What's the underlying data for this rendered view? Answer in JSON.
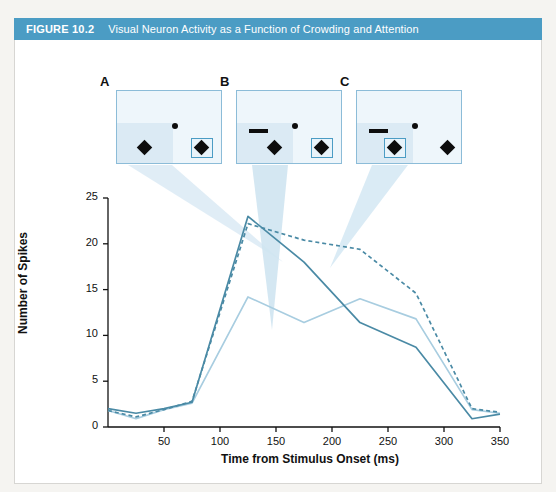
{
  "figure": {
    "number_label": "FIGURE 10.2",
    "title": "Visual Neuron Activity as a Function of Crowding and Attention",
    "header_color": "#4b9cc4",
    "border_color": "#d7d6d3",
    "background_color": "#ffffff"
  },
  "panels": [
    {
      "letter": "A",
      "description": "Isolated target in receptive field, attention directed to right diamond",
      "has_flanker_bar": false,
      "attention_box_on": "right-diamond",
      "items": [
        "fixation-dot",
        "rf-diamond",
        "right-diamond"
      ]
    },
    {
      "letter": "B",
      "description": "Flanker bar added near receptive field, attention directed to right diamond",
      "has_flanker_bar": true,
      "attention_box_on": "right-diamond",
      "items": [
        "flanker-bar",
        "fixation-dot",
        "rf-diamond",
        "right-diamond"
      ]
    },
    {
      "letter": "C",
      "description": "Flanker bar present, attention directed to diamond inside receptive field",
      "has_flanker_bar": true,
      "attention_box_on": "rf-diamond",
      "items": [
        "flanker-bar",
        "fixation-dot",
        "rf-diamond",
        "right-diamond"
      ]
    }
  ],
  "chart_data": {
    "type": "line",
    "title": "",
    "xlabel": "Time from Stimulus Onset (ms)",
    "ylabel": "Number of Spikes",
    "xlim": [
      0,
      350
    ],
    "ylim": [
      0,
      25
    ],
    "xticks": [
      50,
      100,
      150,
      200,
      250,
      300,
      350
    ],
    "yticks": [
      0,
      5,
      10,
      15,
      20,
      25
    ],
    "grid": false,
    "legend_position": "none",
    "x": [
      0,
      25,
      50,
      75,
      125,
      175,
      225,
      275,
      325,
      350
    ],
    "series": [
      {
        "name": "A: isolated target (solid dark blue)",
        "panel": "A",
        "style": "solid",
        "color": "#4a8aa5",
        "width": 1.7,
        "values": [
          2.0,
          1.5,
          2.0,
          2.7,
          23.0,
          18.0,
          11.4,
          8.7,
          0.9,
          1.4
        ]
      },
      {
        "name": "B: crowded, attention elsewhere (dashed dark blue)",
        "panel": "B",
        "style": "dashed",
        "color": "#4a8aa5",
        "width": 1.7,
        "values": [
          1.8,
          1.1,
          1.9,
          2.8,
          22.2,
          20.4,
          19.4,
          14.6,
          2.0,
          1.6
        ]
      },
      {
        "name": "C: crowded, attention in receptive field (solid light blue)",
        "panel": "C",
        "style": "solid",
        "color": "#a8cde0",
        "width": 1.7,
        "values": [
          1.8,
          0.9,
          1.9,
          2.6,
          14.2,
          11.4,
          14.0,
          11.8,
          1.9,
          1.5
        ]
      }
    ]
  },
  "axis": {
    "ytick_labels": [
      "0",
      "5",
      "10",
      "15",
      "20",
      "25"
    ],
    "xtick_labels": [
      "50",
      "100",
      "150",
      "200",
      "250",
      "300",
      "350"
    ]
  }
}
